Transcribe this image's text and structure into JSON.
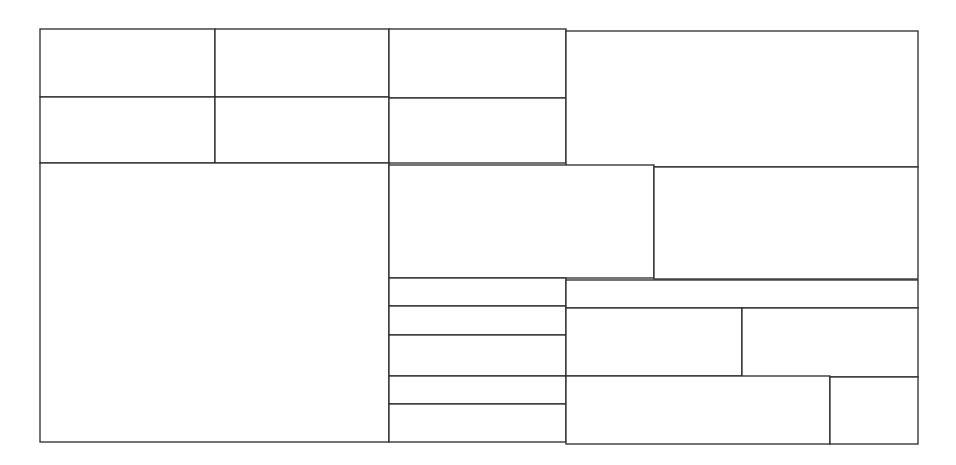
{
  "diagram": {
    "type": "rectangular-partition",
    "line_color": "#2a2a2a",
    "background_color": "#ffffff",
    "cell_count": 18,
    "cells": [
      {
        "id": "r1-c1",
        "label": ""
      },
      {
        "id": "r1-c2",
        "label": ""
      },
      {
        "id": "r1-c3",
        "label": ""
      },
      {
        "id": "r2-c1",
        "label": ""
      },
      {
        "id": "r2-c2",
        "label": ""
      },
      {
        "id": "r2-c3",
        "label": ""
      },
      {
        "id": "top-right",
        "label": ""
      },
      {
        "id": "left-large",
        "label": ""
      },
      {
        "id": "mid-a",
        "label": ""
      },
      {
        "id": "mid-b",
        "label": ""
      },
      {
        "id": "stack-1",
        "label": ""
      },
      {
        "id": "stack-2",
        "label": ""
      },
      {
        "id": "stack-3",
        "label": ""
      },
      {
        "id": "stack-4",
        "label": ""
      },
      {
        "id": "stack-5",
        "label": ""
      },
      {
        "id": "right-strip",
        "label": ""
      },
      {
        "id": "right-mid-a",
        "label": ""
      },
      {
        "id": "right-mid-b",
        "label": ""
      },
      {
        "id": "right-bottom-a",
        "label": ""
      },
      {
        "id": "right-bottom-b",
        "label": ""
      }
    ]
  }
}
